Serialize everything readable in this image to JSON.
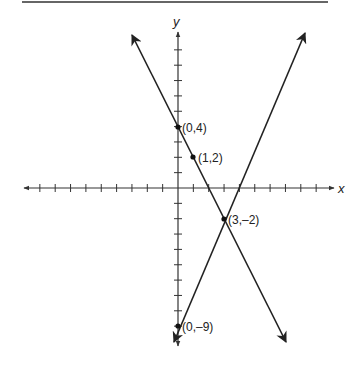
{
  "chart_data": {
    "type": "line",
    "title": "",
    "xlabel": "x",
    "ylabel": "y",
    "xlim": [
      -9,
      9
    ],
    "ylim": [
      -10,
      10
    ],
    "grid": false,
    "tick_spacing": 1,
    "series": [
      {
        "name": "line-decreasing",
        "equation": "y = -2x + 4",
        "x": [
          -3,
          0,
          1,
          3,
          7
        ],
        "y": [
          10,
          4,
          2,
          -2,
          -10
        ]
      },
      {
        "name": "line-increasing",
        "equation": "y = 3x - 9",
        "x": [
          0,
          3,
          8.3
        ],
        "y": [
          -9,
          -2,
          10
        ]
      }
    ],
    "points": [
      {
        "x": 0,
        "y": 4,
        "label": "(0,4)"
      },
      {
        "x": 1,
        "y": 2,
        "label": "(1,2)"
      },
      {
        "x": 3,
        "y": -2,
        "label": "(3,–2)"
      },
      {
        "x": 0,
        "y": -9,
        "label": "(0,–9)"
      }
    ]
  },
  "labels": {
    "x_axis": "x",
    "y_axis": "y",
    "p1": "(0,4)",
    "p2": "(1,2)",
    "p3": "(3,–2)",
    "p4": "(0,–9)"
  },
  "colors": {
    "ink": "#222222",
    "axis": "#333333"
  }
}
